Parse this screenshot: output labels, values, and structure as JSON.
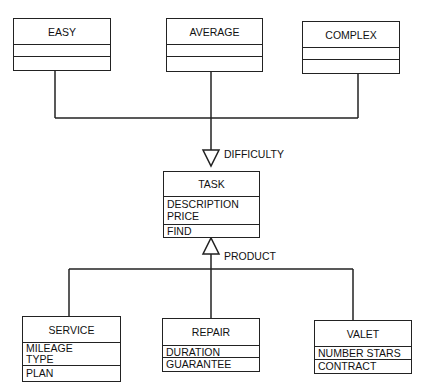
{
  "diagram": {
    "type": "UML class diagram",
    "difficulty_classes": [
      {
        "name": "EASY",
        "attributes": [],
        "operations": []
      },
      {
        "name": "AVERAGE",
        "attributes": [],
        "operations": []
      },
      {
        "name": "COMPLEX",
        "attributes": [],
        "operations": []
      }
    ],
    "task": {
      "name": "TASK",
      "attributes": [
        "DESCRIPTION",
        "PRICE"
      ],
      "operations": [
        "FIND"
      ]
    },
    "product_classes": [
      {
        "name": "SERVICE",
        "attributes": [
          "MILEAGE",
          "TYPE"
        ],
        "operations": [
          "PLAN"
        ]
      },
      {
        "name": "REPAIR",
        "attributes": [
          "DURATION"
        ],
        "operations": [
          "GUARANTEE"
        ]
      },
      {
        "name": "VALET",
        "attributes": [
          "NUMBER STARS"
        ],
        "operations": [
          "CONTRACT"
        ]
      }
    ],
    "relations": [
      {
        "label": "DIFFICULTY",
        "from": [
          "EASY",
          "AVERAGE",
          "COMPLEX"
        ],
        "to": "TASK",
        "kind": "generalization"
      },
      {
        "label": "PRODUCT",
        "from": [
          "SERVICE",
          "REPAIR",
          "VALET"
        ],
        "to": "TASK",
        "kind": "generalization"
      }
    ],
    "colors": {
      "line": "#222222",
      "background": "#ffffff"
    }
  }
}
